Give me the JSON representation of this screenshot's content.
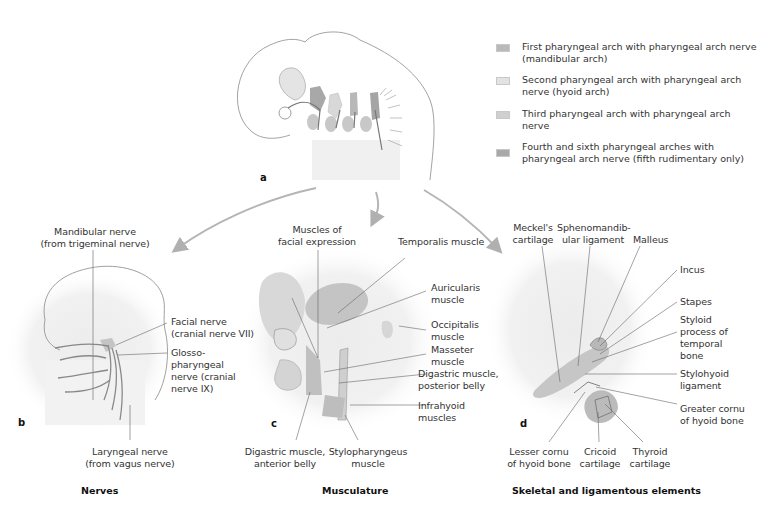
{
  "legend": [
    {
      "line1": "First pharyngeal arch with pharyngeal arch nerve",
      "line2": "(mandibular arch)",
      "color": "#b9b9b9"
    },
    {
      "line1": "Second pharyngeal arch with pharyngeal arch",
      "line2": "nerve (hyoid arch)",
      "color": "#e3e3e3"
    },
    {
      "line1": "Third pharyngeal arch with pharyngeal arch nerve",
      "line2": "",
      "color": "#cfcfcf"
    },
    {
      "line1": "Fourth and sixth pharyngeal arches with",
      "line2": "pharyngeal arch nerve (fifth rudimentary only)",
      "color": "#a9a9a9"
    }
  ],
  "panels": {
    "a": {
      "letter": "a"
    },
    "b": {
      "letter": "b",
      "caption": "Nerves",
      "labels": {
        "mandibular_1": "Mandibular nerve",
        "mandibular_2": "(from trigeminal nerve)",
        "facial_1": "Facial nerve",
        "facial_2": "(cranial nerve VII)",
        "glosso_1": "Glosso-",
        "glosso_2": "pharyngeal",
        "glosso_3": "nerve (cranial",
        "glosso_4": "nerve IX)",
        "laryngeal_1": "Laryngeal nerve",
        "laryngeal_2": "(from vagus nerve)"
      }
    },
    "c": {
      "letter": "c",
      "caption": "Musculature",
      "labels": {
        "facial_expr_1": "Muscles of",
        "facial_expr_2": "facial expression",
        "temporalis": "Temporalis muscle",
        "auricularis_1": "Auricularis",
        "auricularis_2": "muscle",
        "occipitalis_1": "Occipitalis",
        "occipitalis_2": "muscle",
        "masseter_1": "Masseter",
        "masseter_2": "muscle",
        "digastric_post_1": "Digastric muscle,",
        "digastric_post_2": "posterior belly",
        "infrahyoid_1": "Infrahyoid",
        "infrahyoid_2": "muscles",
        "digastric_ant_1": "Digastric muscle,",
        "digastric_ant_2": "anterior belly",
        "stylopharyngeus_1": "Stylopharyngeus",
        "stylopharyngeus_2": "muscle"
      }
    },
    "d": {
      "letter": "d",
      "caption": "Skeletal and ligamentous elements",
      "labels": {
        "meckel_1": "Meckel's",
        "meckel_2": "cartilage",
        "spheno_1": "Sphenomandib-",
        "spheno_2": "ular ligament",
        "malleus": "Malleus",
        "incus": "Incus",
        "stapes": "Stapes",
        "styloid_1": "Styloid",
        "styloid_2": "process of",
        "styloid_3": "temporal",
        "styloid_4": "bone",
        "stylohyoid_1": "Stylohyoid",
        "stylohyoid_2": "ligament",
        "greater_1": "Greater cornu",
        "greater_2": "of hyoid bone",
        "lesser_1": "Lesser cornu",
        "lesser_2": "of hyoid bone",
        "cricoid_1": "Cricoid",
        "cricoid_2": "cartilage",
        "thyroid_1": "Thyroid",
        "thyroid_2": "cartilage"
      }
    }
  }
}
